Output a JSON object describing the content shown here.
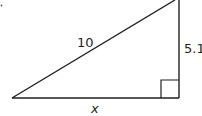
{
  "diagram": {
    "type": "right-triangle",
    "stroke_color": "#231f20",
    "background": "#ffffff",
    "hypotenuse": {
      "label": "10"
    },
    "vertical_leg": {
      "label": "5.1"
    },
    "horizontal_leg": {
      "label": "x"
    },
    "right_angle_marker": "bottom-right"
  }
}
